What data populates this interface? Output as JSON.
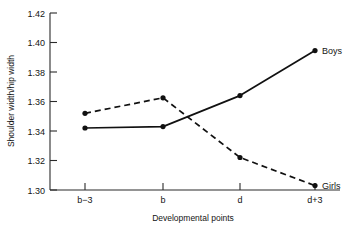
{
  "chart_data": {
    "type": "line",
    "title": "",
    "xlabel": "Developmental points",
    "ylabel": "Shoulder width/hip width",
    "categories": [
      "b−3",
      "b",
      "d",
      "d+3"
    ],
    "ylim": [
      1.3,
      1.42
    ],
    "ytick_labels": [
      "1.42",
      "1.40",
      "1.38",
      "1.36",
      "1.34",
      "1.32",
      "1.30"
    ],
    "ytick_values": [
      1.42,
      1.4,
      1.38,
      1.36,
      1.34,
      1.32,
      1.3
    ],
    "grid": false,
    "legend_position": "inline-line-end",
    "series": [
      {
        "name": "Boys",
        "style": "solid",
        "marker": "filled-circle",
        "values": [
          1.342,
          1.343,
          1.364,
          1.3945
        ]
      },
      {
        "name": "Girls",
        "style": "dashed",
        "marker": "filled-circle",
        "values": [
          1.352,
          1.3625,
          1.322,
          1.303
        ]
      }
    ],
    "annotations": [
      {
        "text": "Boys",
        "series": "Boys",
        "at_category": "d+3"
      },
      {
        "text": "Girls",
        "series": "Girls",
        "at_category": "d+3"
      }
    ]
  },
  "geometry": {
    "plot_left": 50,
    "plot_right": 316,
    "plot_top": 13,
    "plot_bottom": 190,
    "category_x": [
      85,
      163,
      240,
      315
    ]
  }
}
